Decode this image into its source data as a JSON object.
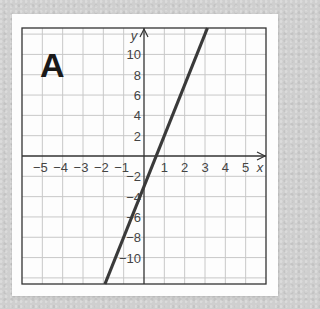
{
  "panel": {
    "label": "A"
  },
  "colors": {
    "background": "#cfcfcf",
    "card": "#fdfdfd",
    "grid": "#c8c8c8",
    "axis": "#333333",
    "line": "#3a3a3a",
    "text": "#444444"
  },
  "chart_data": {
    "type": "line",
    "title": "A",
    "xlabel": "x",
    "ylabel": "y",
    "xlim": [
      -6,
      6
    ],
    "ylim": [
      -12.6,
      12.6
    ],
    "grid": true,
    "x_grid_step": 1,
    "y_grid_step": 2,
    "x_tick_labels": [
      "-5",
      "-4",
      "-3",
      "-2",
      "-1",
      "1",
      "2",
      "3",
      "4",
      "5"
    ],
    "y_tick_labels": [
      "10",
      "8",
      "6",
      "4",
      "2",
      "-2",
      "-4",
      "-6",
      "-8",
      "-10"
    ],
    "series": [
      {
        "name": "y = 5x - 3",
        "slope": 5,
        "intercept": -3,
        "x": [
          -1.92,
          3.12
        ],
        "y": [
          -12.6,
          12.6
        ]
      }
    ],
    "legend": null
  }
}
